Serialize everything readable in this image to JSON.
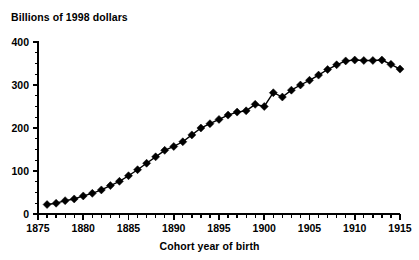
{
  "chart_data": {
    "type": "line",
    "title": "",
    "ylabel": "Billions of 1998 dollars",
    "xlabel": "Cohort year of birth",
    "grid": false,
    "legend": null,
    "marker": "filled-diamond",
    "color": "#000000",
    "xlim": [
      1875,
      1915
    ],
    "ylim": [
      0,
      400
    ],
    "ytick_labels": [
      "0",
      "100",
      "200",
      "300",
      "400"
    ],
    "ytick_values": [
      0,
      100,
      200,
      300,
      400
    ],
    "yminor_step": 25,
    "xtick_labels": [
      "1875",
      "1880",
      "1885",
      "1890",
      "1895",
      "1900",
      "1905",
      "1910",
      "1915"
    ],
    "xtick_values": [
      1875,
      1880,
      1885,
      1890,
      1895,
      1900,
      1905,
      1910,
      1915
    ],
    "xminor_step": 1,
    "x": [
      1876,
      1877,
      1878,
      1879,
      1880,
      1881,
      1882,
      1883,
      1884,
      1885,
      1886,
      1887,
      1888,
      1889,
      1890,
      1891,
      1892,
      1893,
      1894,
      1895,
      1896,
      1897,
      1898,
      1899,
      1900,
      1901,
      1902,
      1903,
      1904,
      1905,
      1906,
      1907,
      1908,
      1909,
      1910,
      1911,
      1912,
      1913,
      1914,
      1915
    ],
    "values": [
      22,
      25,
      31,
      35,
      42,
      48,
      56,
      66,
      76,
      89,
      103,
      118,
      133,
      148,
      157,
      168,
      184,
      200,
      210,
      220,
      230,
      237,
      240,
      243,
      255,
      250,
      282,
      272,
      288,
      300,
      311,
      323,
      336,
      347,
      356,
      358,
      357,
      357,
      358,
      357
    ],
    "series": [
      {
        "name": "Billions of 1998 dollars",
        "values": [
          22,
          25,
          31,
          35,
          42,
          48,
          56,
          66,
          76,
          89,
          103,
          118,
          133,
          148,
          157,
          168,
          184,
          200,
          210,
          220,
          230,
          237,
          240,
          243,
          255,
          250,
          282,
          272,
          288,
          300,
          311,
          323,
          336,
          347,
          356,
          358,
          357,
          357,
          358,
          357
        ]
      }
    ],
    "points": [
      {
        "x": 1876,
        "y": 22
      },
      {
        "x": 1877,
        "y": 25
      },
      {
        "x": 1878,
        "y": 31
      },
      {
        "x": 1879,
        "y": 35
      },
      {
        "x": 1880,
        "y": 42
      },
      {
        "x": 1881,
        "y": 48
      },
      {
        "x": 1882,
        "y": 56
      },
      {
        "x": 1883,
        "y": 66
      },
      {
        "x": 1884,
        "y": 76
      },
      {
        "x": 1885,
        "y": 89
      },
      {
        "x": 1886,
        "y": 103
      },
      {
        "x": 1887,
        "y": 118
      },
      {
        "x": 1888,
        "y": 133
      },
      {
        "x": 1889,
        "y": 148
      },
      {
        "x": 1890,
        "y": 157
      },
      {
        "x": 1891,
        "y": 168
      },
      {
        "x": 1892,
        "y": 184
      },
      {
        "x": 1893,
        "y": 200
      },
      {
        "x": 1894,
        "y": 210
      },
      {
        "x": 1895,
        "y": 220
      },
      {
        "x": 1896,
        "y": 230
      },
      {
        "x": 1897,
        "y": 237
      },
      {
        "x": 1898,
        "y": 240
      },
      {
        "x": 1899,
        "y": 255
      },
      {
        "x": 1900,
        "y": 250
      },
      {
        "x": 1901,
        "y": 282
      },
      {
        "x": 1902,
        "y": 272
      },
      {
        "x": 1903,
        "y": 288
      },
      {
        "x": 1904,
        "y": 300
      },
      {
        "x": 1905,
        "y": 311
      },
      {
        "x": 1906,
        "y": 323
      },
      {
        "x": 1907,
        "y": 336
      },
      {
        "x": 1908,
        "y": 347
      },
      {
        "x": 1909,
        "y": 356
      },
      {
        "x": 1910,
        "y": 358
      },
      {
        "x": 1911,
        "y": 357
      },
      {
        "x": 1912,
        "y": 357
      },
      {
        "x": 1913,
        "y": 358
      },
      {
        "x": 1914,
        "y": 348
      },
      {
        "x": 1915,
        "y": 337
      }
    ]
  }
}
